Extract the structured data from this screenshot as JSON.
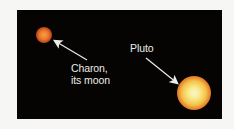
{
  "figure": {
    "background_color": "#050403",
    "objects": [
      {
        "name": "Charon",
        "color": "#e9782a"
      },
      {
        "name": "Pluto",
        "color": "#f5c24a"
      }
    ],
    "labels": {
      "charon_line1": "Charon,",
      "charon_line2": "its moon",
      "pluto": "Pluto"
    }
  }
}
